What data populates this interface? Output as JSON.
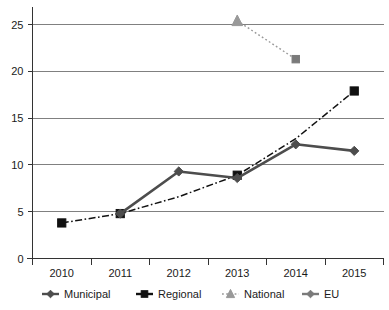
{
  "chart_data": {
    "type": "line",
    "title": "",
    "subtitle": "",
    "xlabel": "",
    "ylabel": "",
    "categories": [
      "2010",
      "2011",
      "2012",
      "2013",
      "2014",
      "2015"
    ],
    "ylim": [
      0,
      26.5
    ],
    "yticks": [
      0,
      5,
      10,
      15,
      20,
      25
    ],
    "ytick_labels": [
      "0",
      "5",
      "10",
      "15",
      "20",
      "25"
    ],
    "grid": true,
    "legend_position": "bottom",
    "series": [
      {
        "name": "Municipal",
        "marker": "diamond",
        "line_style": "solid",
        "color": "#4d4d4d",
        "x": [
          "2011",
          "2012",
          "2013",
          "2014",
          "2015"
        ],
        "values": [
          4.8,
          9.3,
          8.6,
          12.2,
          11.5
        ]
      },
      {
        "name": "Regional",
        "marker": "square",
        "line_style": "dash-dot",
        "color": "#111111",
        "x": [
          "2010",
          "2011",
          "2012",
          "2013",
          "2014",
          "2015"
        ],
        "values": [
          3.8,
          4.8,
          6.6,
          8.9,
          12.8,
          17.9
        ]
      },
      {
        "name": "National",
        "marker": "triangle",
        "line_style": "dotted",
        "color": "#999999",
        "x": [
          "2013"
        ],
        "values": [
          25.4
        ]
      },
      {
        "name": "EU",
        "marker": "square",
        "line_style": "solid",
        "color": "#7a7a7a",
        "x": [
          "2014"
        ],
        "values": [
          21.3
        ]
      }
    ],
    "annotations": [
      {
        "label": "national-to-eu-connector",
        "from": {
          "x": "2013",
          "y": 25.4
        },
        "to": {
          "x": "2014",
          "y": 21.3
        },
        "style": "dotted",
        "color": "#999999"
      }
    ]
  },
  "legend": {
    "entries": [
      {
        "label": "Municipal",
        "marker": "diamond",
        "color": "#4d4d4d",
        "line_style": "solid"
      },
      {
        "label": "Regional",
        "marker": "square",
        "color": "#111111",
        "line_style": "solid"
      },
      {
        "label": "National",
        "marker": "triangle",
        "color": "#999999",
        "line_style": "dotted"
      },
      {
        "label": "EU",
        "marker": "diamond",
        "color": "#7a7a7a",
        "line_style": "solid"
      }
    ]
  }
}
